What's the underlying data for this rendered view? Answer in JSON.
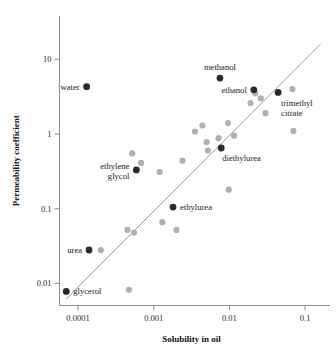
{
  "chart_data": {
    "type": "scatter",
    "title": "",
    "xlabel": "Solubility in oil",
    "ylabel": "Permeability coefficient",
    "xscale": "log",
    "yscale": "log",
    "xlim": [
      6e-05,
      0.2
    ],
    "ylim": [
      0.005,
      30
    ],
    "xticks": [
      0.0001,
      0.001,
      0.01,
      0.1
    ],
    "xtick_labels": [
      "0.0001",
      "0.001",
      "0.01",
      "0.1"
    ],
    "yticks": [
      0.01,
      0.1,
      1,
      10
    ],
    "ytick_labels": [
      "0.01",
      "0.1",
      "1",
      "10"
    ],
    "grid": false,
    "legend": "none",
    "trendline": {
      "x0": 7e-05,
      "y0": 0.0062,
      "x1": 0.16,
      "y1": 16.0
    },
    "labeled_points": [
      {
        "label": "water",
        "x": 0.00013,
        "y": 4.3,
        "label_pos": "left"
      },
      {
        "label": "methanol",
        "x": 0.0075,
        "y": 5.6,
        "label_pos": "above"
      },
      {
        "label": "ethanol",
        "x": 0.021,
        "y": 3.9,
        "label_pos": "left"
      },
      {
        "label": "trimethyl citrate",
        "x": 0.044,
        "y": 3.6,
        "label_pos": "below-right"
      },
      {
        "label": "diethylurea",
        "x": 0.0078,
        "y": 0.65,
        "label_pos": "below-right"
      },
      {
        "label": "ethylene glycol",
        "x": 0.00059,
        "y": 0.33,
        "label_pos": "left"
      },
      {
        "label": "ethylurea",
        "x": 0.0018,
        "y": 0.105,
        "label_pos": "right"
      },
      {
        "label": "urea",
        "x": 0.00014,
        "y": 0.028,
        "label_pos": "left"
      },
      {
        "label": "glycerol",
        "x": 7e-05,
        "y": 0.0078,
        "label_pos": "right"
      }
    ],
    "unlabeled_points": [
      {
        "x": 0.0002,
        "y": 0.028
      },
      {
        "x": 0.00047,
        "y": 0.0082
      },
      {
        "x": 0.00045,
        "y": 0.052
      },
      {
        "x": 0.00055,
        "y": 0.048
      },
      {
        "x": 0.00052,
        "y": 0.55
      },
      {
        "x": 0.00068,
        "y": 0.41
      },
      {
        "x": 0.0013,
        "y": 0.066
      },
      {
        "x": 0.0012,
        "y": 0.31
      },
      {
        "x": 0.002,
        "y": 0.052
      },
      {
        "x": 0.0024,
        "y": 0.44
      },
      {
        "x": 0.0035,
        "y": 1.08
      },
      {
        "x": 0.0044,
        "y": 1.3
      },
      {
        "x": 0.005,
        "y": 0.78
      },
      {
        "x": 0.0052,
        "y": 0.6
      },
      {
        "x": 0.0072,
        "y": 0.88
      },
      {
        "x": 0.0096,
        "y": 1.4
      },
      {
        "x": 0.0098,
        "y": 0.18
      },
      {
        "x": 0.0115,
        "y": 0.95
      },
      {
        "x": 0.019,
        "y": 2.6
      },
      {
        "x": 0.022,
        "y": 3.5
      },
      {
        "x": 0.026,
        "y": 3.0
      },
      {
        "x": 0.03,
        "y": 1.9
      },
      {
        "x": 0.068,
        "y": 4.0
      },
      {
        "x": 0.07,
        "y": 1.1
      }
    ],
    "colors": {
      "labeled_marker": "#2a2a2a",
      "unlabeled_marker": "#b0b0b0",
      "trendline": "#9a9a9a",
      "axis": "#8c8c8c",
      "text": "#1a1a1a",
      "background": "#ffffff"
    }
  }
}
